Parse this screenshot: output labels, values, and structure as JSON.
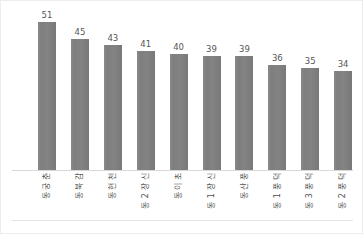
{
  "chart_data": {
    "type": "bar",
    "title": "",
    "subtitle": "",
    "xlabel": "",
    "ylabel": "",
    "ylim": [
      0,
      56
    ],
    "grid": false,
    "legend": "none",
    "orientation": "vertical",
    "tick_label_rotation": -90,
    "bar_color": "#808080",
    "categories": [
      "춘궁동",
      "감북동",
      "천현동",
      "신장2동",
      "초이동",
      "신장1동",
      "풍산동",
      "덕풍1동",
      "덕풍3동",
      "덕풍2동"
    ],
    "values": [
      51,
      45,
      43,
      41,
      40,
      39,
      39,
      36,
      35,
      34
    ],
    "data_labels": [
      "51",
      "45",
      "43",
      "41",
      "40",
      "39",
      "39",
      "36",
      "35",
      "34"
    ]
  }
}
